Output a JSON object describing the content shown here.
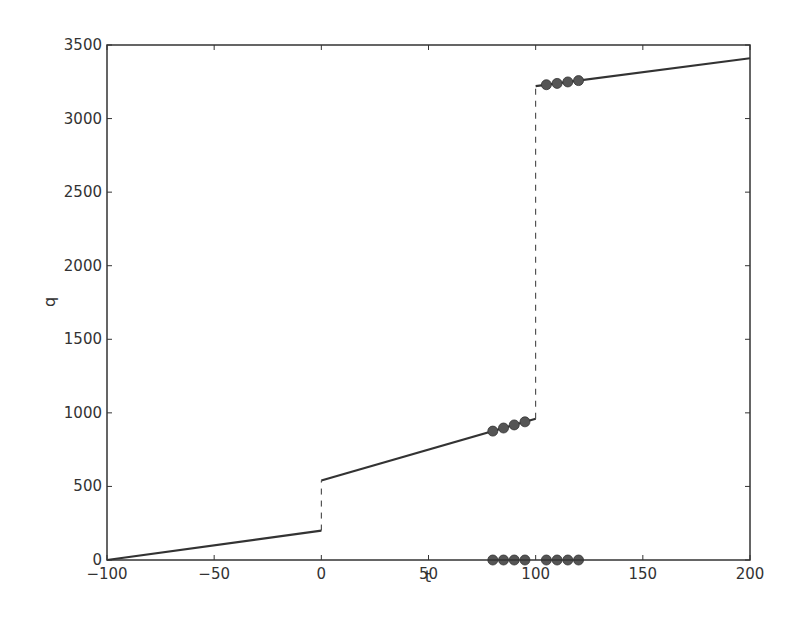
{
  "chart_data": {
    "type": "line",
    "title": "",
    "xlabel": "t",
    "ylabel": "q",
    "xlim": [
      -100,
      200
    ],
    "ylim": [
      0,
      3500
    ],
    "grid": false,
    "legend": null,
    "x_ticks": [
      -100,
      -50,
      0,
      50,
      100,
      150,
      200
    ],
    "x_tick_labels": [
      "−100",
      "−50",
      "0",
      "50",
      "100",
      "150",
      "200"
    ],
    "y_ticks": [
      0,
      500,
      1000,
      1500,
      2000,
      2500,
      3000,
      3500
    ],
    "y_tick_labels": [
      "0",
      "500",
      "1000",
      "1500",
      "2000",
      "2500",
      "3000",
      "3500"
    ],
    "series": [
      {
        "name": "segment-1",
        "style": "solid",
        "x": [
          -100,
          0
        ],
        "y": [
          0,
          200
        ]
      },
      {
        "name": "segment-2",
        "style": "solid",
        "x": [
          0,
          100
        ],
        "y": [
          540,
          960
        ]
      },
      {
        "name": "segment-3",
        "style": "solid",
        "x": [
          100,
          200
        ],
        "y": [
          3220,
          3410
        ]
      },
      {
        "name": "jump-1",
        "style": "dashed",
        "x": [
          0,
          0
        ],
        "y": [
          200,
          540
        ]
      },
      {
        "name": "jump-2",
        "style": "dashed",
        "x": [
          100,
          100
        ],
        "y": [
          960,
          3220
        ]
      },
      {
        "name": "markers-mid",
        "style": "markers",
        "x": [
          80,
          85,
          90,
          95
        ],
        "y": [
          876,
          897,
          918,
          939
        ]
      },
      {
        "name": "markers-upper",
        "style": "markers",
        "x": [
          105,
          110,
          115,
          120
        ],
        "y": [
          3230,
          3239,
          3249,
          3258
        ]
      },
      {
        "name": "markers-baseline",
        "style": "markers",
        "x": [
          80,
          85,
          90,
          95,
          105,
          110,
          115,
          120
        ],
        "y": [
          0,
          0,
          0,
          0,
          0,
          0,
          0,
          0
        ]
      }
    ],
    "colors": {
      "line": "#333333",
      "marker": "#555555",
      "axis": "#333333"
    }
  }
}
